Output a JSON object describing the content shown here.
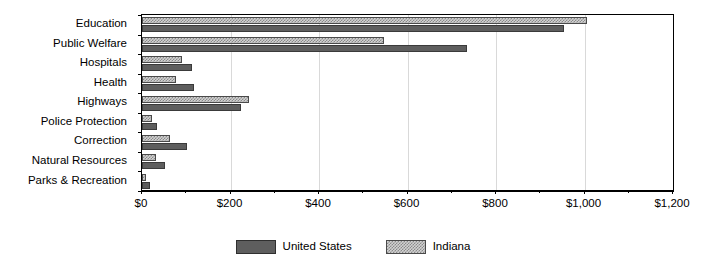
{
  "chart_data": {
    "type": "bar",
    "orientation": "horizontal",
    "title": "",
    "xlabel": "",
    "ylabel": "",
    "xlim": [
      0,
      1200
    ],
    "xticks": [
      0,
      200,
      400,
      600,
      800,
      1000,
      1200
    ],
    "xtick_labels": [
      "$0",
      "$200",
      "$400",
      "$600",
      "$800",
      "$1,000",
      "$1,200"
    ],
    "minor_tick_interval": 100,
    "grid": "vertical-major",
    "legend_position": "bottom-center",
    "categories": [
      "Education",
      "Public Welfare",
      "Hospitals",
      "Health",
      "Highways",
      "Police Protection",
      "Correction",
      "Natural Resources",
      "Parks & Recreation"
    ],
    "series": [
      {
        "name": "United States",
        "color": "#5e5e5e",
        "pattern": "solid",
        "values": [
          953,
          735,
          113,
          117,
          224,
          33,
          102,
          52,
          18
        ]
      },
      {
        "name": "Indiana",
        "color": "#d2d2d2",
        "pattern": "stipple",
        "values": [
          1006,
          546,
          90,
          77,
          242,
          23,
          63,
          32,
          9
        ]
      }
    ]
  },
  "legend": {
    "items": [
      {
        "label": "United States",
        "key": "us"
      },
      {
        "label": "Indiana",
        "key": "indiana"
      }
    ]
  }
}
